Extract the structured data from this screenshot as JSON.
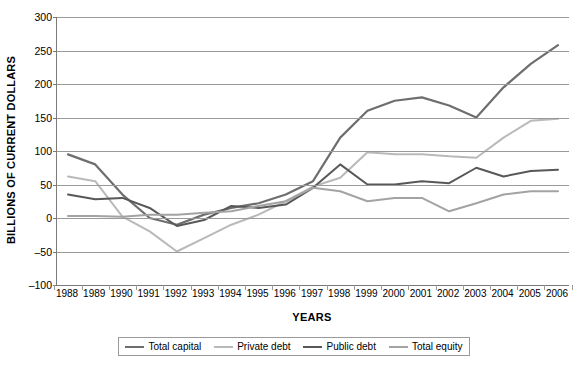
{
  "chart_data": {
    "type": "line",
    "title": "",
    "xlabel": "YEARS",
    "ylabel": "BILLIONS OF CURRENT DOLLARS",
    "ylim": [
      -100,
      300
    ],
    "ytick_step": 50,
    "yticks": [
      300,
      250,
      200,
      150,
      100,
      50,
      0,
      -50,
      -100
    ],
    "grid": true,
    "legend_position": "bottom",
    "categories": [
      "1988",
      "1989",
      "1990",
      "1991",
      "1992",
      "1993",
      "1994",
      "1995",
      "1996",
      "1997",
      "1998",
      "1999",
      "2000",
      "2001",
      "2002",
      "2003",
      "2004",
      "2005",
      "2006"
    ],
    "series": [
      {
        "name": "Total capital",
        "color": "#6e6e6e",
        "width": 2.2,
        "values": [
          95,
          80,
          35,
          0,
          -10,
          5,
          15,
          22,
          35,
          55,
          120,
          160,
          175,
          180,
          168,
          150,
          195,
          230,
          258
        ]
      },
      {
        "name": "Private debt",
        "color": "#b9b9b9",
        "width": 2.0,
        "values": [
          62,
          55,
          2,
          -20,
          -50,
          -30,
          -10,
          5,
          25,
          47,
          60,
          98,
          95,
          95,
          92,
          90,
          120,
          145,
          148
        ]
      },
      {
        "name": "Public debt",
        "color": "#585858",
        "width": 2.0,
        "values": [
          35,
          28,
          30,
          15,
          -12,
          -3,
          18,
          15,
          20,
          45,
          80,
          50,
          50,
          55,
          52,
          75,
          62,
          70,
          72
        ]
      },
      {
        "name": "Total equity",
        "color": "#a3a3a3",
        "width": 2.0,
        "values": [
          3,
          3,
          2,
          5,
          5,
          8,
          10,
          18,
          25,
          45,
          40,
          25,
          30,
          30,
          10,
          22,
          35,
          40,
          40
        ]
      }
    ],
    "series_last_point": {
      "note_year": "2006",
      "total_capital_2006": 250,
      "private_debt_2006": 140,
      "public_debt_2006": 70,
      "total_equity_2006": 45
    }
  },
  "legend": {
    "items": [
      {
        "label": "Total capital"
      },
      {
        "label": "Private debt"
      },
      {
        "label": "Public debt"
      },
      {
        "label": "Total equity"
      }
    ]
  }
}
